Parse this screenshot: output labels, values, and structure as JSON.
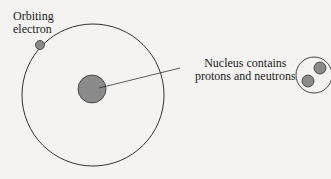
{
  "diagram": {
    "labels": {
      "electron": [
        "Orbiting",
        "electron"
      ],
      "nucleus": [
        "Nucleus contains",
        "protons and neutrons"
      ]
    },
    "colors": {
      "background": "#f4f3f1",
      "stroke": "#333333",
      "particle_fill": "#8a8a8a"
    }
  }
}
